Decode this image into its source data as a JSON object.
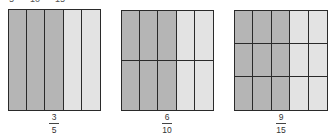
{
  "top_labels": [
    {
      "text": "5",
      "x": 9
    },
    {
      "text": "10",
      "x": 30
    },
    {
      "text": "15",
      "x": 55
    }
  ],
  "colors": {
    "shaded": "#b5b5b5",
    "unshaded": "#e3e3e3",
    "grid_line": "#2a2a2a"
  },
  "panels": [
    {
      "rows": 1,
      "cols": 5,
      "shaded_cols": 3,
      "left": 8,
      "top": 9,
      "width": 93,
      "height": 102,
      "fraction": {
        "numerator": "3",
        "denominator": "5",
        "center_x": 54
      }
    },
    {
      "rows": 2,
      "cols": 5,
      "shaded_cols": 3,
      "left": 121,
      "top": 10,
      "width": 93,
      "height": 101,
      "fraction": {
        "numerator": "6",
        "denominator": "10",
        "center_x": 167
      }
    },
    {
      "rows": 3,
      "cols": 5,
      "shaded_cols": 3,
      "left": 234,
      "top": 10,
      "width": 94,
      "height": 101,
      "fraction": {
        "numerator": "9",
        "denominator": "15",
        "center_x": 281
      }
    }
  ]
}
